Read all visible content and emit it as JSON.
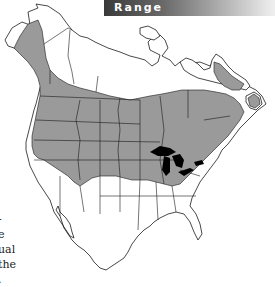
{
  "header": {
    "title": "Range"
  },
  "map": {
    "region": "North America",
    "range_fill_color": "#9a9a9a",
    "lake_fill_color": "#000000",
    "border_color": "#1a1a1a"
  },
  "side_text": {
    "lines": [
      "-",
      "e",
      "ual",
      " the",
      "."
    ]
  }
}
